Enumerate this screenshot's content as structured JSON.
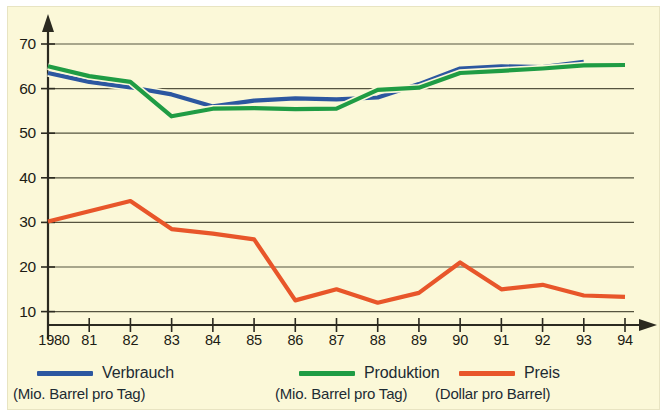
{
  "figure": {
    "background_color": "#fbf8d8",
    "outer_color": "#ffffff",
    "axis_color": "#2b2a20",
    "grid_color": "#55543f"
  },
  "legend": {
    "position": "below-axis",
    "entries": [
      {
        "label": "Verbrauch",
        "sublabel": "(Mio. Barrel pro Tag)",
        "color": "#2c57a0",
        "swatch": "line-swatch-blue"
      },
      {
        "label": "Produktion",
        "sublabel": "(Mio. Barrel pro Tag)",
        "color": "#1f9c44",
        "swatch": "line-swatch-green"
      },
      {
        "label": "Preis",
        "sublabel": "(Dollar pro Barrel)",
        "color": "#e8562a",
        "swatch": "line-swatch-orange"
      }
    ]
  },
  "chart_data": {
    "type": "line",
    "title": "",
    "subtitle": "",
    "xlabel": "",
    "ylabel": "",
    "grid": true,
    "xlim": [
      1980,
      1994
    ],
    "ylim": [
      0,
      75
    ],
    "yticks": [
      10,
      20,
      30,
      40,
      50,
      60,
      70
    ],
    "ytick_labels": [
      "10",
      "20",
      "30",
      "40",
      "50",
      "60",
      "70"
    ],
    "x": [
      1980,
      1981,
      1982,
      1983,
      1984,
      1985,
      1986,
      1987,
      1988,
      1989,
      1990,
      1991,
      1992,
      1993,
      1994
    ],
    "xtick_labels": [
      "1980",
      "81",
      "82",
      "83",
      "84",
      "85",
      "86",
      "87",
      "88",
      "89",
      "90",
      "91",
      "92",
      "93",
      "94"
    ],
    "series": [
      {
        "name": "Verbrauch",
        "unit": "Mio. Barrel pro Tag",
        "color": "#2c57a0",
        "values": [
          63.5,
          61.5,
          60.3,
          58.7,
          56.0,
          57.3,
          57.8,
          57.6,
          58.0,
          61.0,
          64.5,
          65.0,
          64.8,
          66.0,
          null
        ]
      },
      {
        "name": "Produktion",
        "unit": "Mio. Barrel pro Tag",
        "color": "#1f9c44",
        "values": [
          65.0,
          62.8,
          61.5,
          53.8,
          55.5,
          55.6,
          55.4,
          55.5,
          59.7,
          60.2,
          63.5,
          64.0,
          64.5,
          65.2,
          65.3
        ]
      },
      {
        "name": "Preis",
        "unit": "Dollar pro Barrel",
        "color": "#e8562a",
        "values": [
          30.2,
          32.5,
          34.8,
          28.5,
          27.5,
          26.2,
          12.5,
          15.0,
          12.0,
          14.2,
          21.0,
          15.0,
          16.0,
          13.6,
          13.3
        ]
      }
    ]
  }
}
